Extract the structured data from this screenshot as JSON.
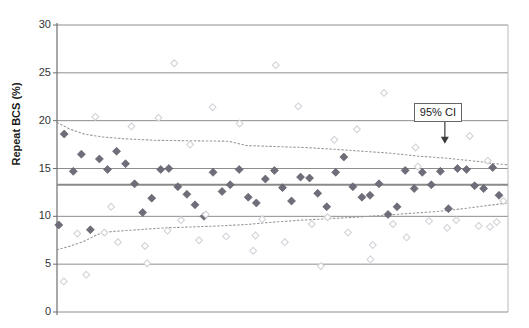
{
  "chart": {
    "type": "scatter",
    "ylabel": "Repeat BCS (%)",
    "annotation_label": "95% CI"
  },
  "axis": {
    "ticks": [
      "30",
      "25",
      "20",
      "15",
      "10",
      "5",
      "0"
    ]
  },
  "chart_data": {
    "type": "scatter",
    "title": "",
    "xlabel": "",
    "ylabel": "Repeat BCS (%)",
    "ylim": [
      0,
      30
    ],
    "xlim": [
      0,
      100
    ],
    "yticks": [
      0,
      5,
      10,
      15,
      20,
      25,
      30
    ],
    "grid": true,
    "legend": false,
    "annotations": [
      {
        "text": "95% CI",
        "x": 86,
        "y": 21.0,
        "arrow_to_x": 86,
        "arrow_to_y": 17.6
      }
    ],
    "reference_lines": [
      {
        "name": "mean",
        "value": 13.3,
        "style": "solid",
        "color": "#8a8a8a",
        "width": 2.2
      }
    ],
    "series": [
      {
        "name": "Cumulative mean (filled diamonds)",
        "marker": "filled-diamond",
        "color": "#6e6e7a",
        "points": [
          [
            0.4,
            9.1
          ],
          [
            1.6,
            18.6
          ],
          [
            3.6,
            14.7
          ],
          [
            5.4,
            16.5
          ],
          [
            7.4,
            8.6
          ],
          [
            9.4,
            16.0
          ],
          [
            11.2,
            14.9
          ],
          [
            13.2,
            16.8
          ],
          [
            15.2,
            15.5
          ],
          [
            17.2,
            13.4
          ],
          [
            19.0,
            10.4
          ],
          [
            21.0,
            11.9
          ],
          [
            23.0,
            14.9
          ],
          [
            24.8,
            15.0
          ],
          [
            26.8,
            13.1
          ],
          [
            28.8,
            12.3
          ],
          [
            30.6,
            11.2
          ],
          [
            32.6,
            10.0
          ],
          [
            34.6,
            14.6
          ],
          [
            36.6,
            12.6
          ],
          [
            38.4,
            13.3
          ],
          [
            40.4,
            14.9
          ],
          [
            42.4,
            12.0
          ],
          [
            44.2,
            11.4
          ],
          [
            46.2,
            13.9
          ],
          [
            48.2,
            14.8
          ],
          [
            50.0,
            13.0
          ],
          [
            52.0,
            11.6
          ],
          [
            54.0,
            14.1
          ],
          [
            56.0,
            14.0
          ],
          [
            57.8,
            12.4
          ],
          [
            59.8,
            11.0
          ],
          [
            61.8,
            14.6
          ],
          [
            63.6,
            16.2
          ],
          [
            65.6,
            13.1
          ],
          [
            67.6,
            12.0
          ],
          [
            69.4,
            12.2
          ],
          [
            71.4,
            13.4
          ],
          [
            73.4,
            10.2
          ],
          [
            75.4,
            11.0
          ],
          [
            77.2,
            14.8
          ],
          [
            79.2,
            12.9
          ],
          [
            81.0,
            14.6
          ],
          [
            83.0,
            13.3
          ],
          [
            85.0,
            14.7
          ],
          [
            86.8,
            10.8
          ],
          [
            88.8,
            15.0
          ],
          [
            90.8,
            14.9
          ],
          [
            92.6,
            13.2
          ],
          [
            94.6,
            12.9
          ],
          [
            96.6,
            15.1
          ],
          [
            98.0,
            12.2
          ]
        ]
      },
      {
        "name": "Individual observations (open diamonds)",
        "marker": "open-diamond",
        "color": "#d2d2d8",
        "points": [
          [
            1.5,
            3.2
          ],
          [
            4.5,
            8.2
          ],
          [
            6.5,
            3.9
          ],
          [
            8.5,
            20.4
          ],
          [
            10.5,
            8.3
          ],
          [
            13.5,
            7.3
          ],
          [
            16.5,
            19.4
          ],
          [
            19.5,
            6.9
          ],
          [
            22.5,
            20.3
          ],
          [
            24.5,
            8.5
          ],
          [
            27.5,
            9.6
          ],
          [
            29.5,
            17.5
          ],
          [
            31.5,
            7.5
          ],
          [
            34.5,
            21.4
          ],
          [
            37.5,
            7.9
          ],
          [
            40.5,
            19.7
          ],
          [
            43.5,
            6.4
          ],
          [
            45.5,
            9.7
          ],
          [
            48.5,
            25.8
          ],
          [
            50.5,
            7.3
          ],
          [
            53.5,
            21.5
          ],
          [
            56.5,
            9.2
          ],
          [
            58.5,
            4.8
          ],
          [
            61.5,
            18.0
          ],
          [
            64.5,
            8.3
          ],
          [
            66.5,
            19.1
          ],
          [
            69.5,
            5.5
          ],
          [
            72.5,
            22.9
          ],
          [
            74.5,
            9.2
          ],
          [
            77.5,
            7.8
          ],
          [
            79.5,
            17.2
          ],
          [
            82.5,
            9.5
          ],
          [
            84.5,
            20.5
          ],
          [
            86.5,
            8.8
          ],
          [
            88.5,
            9.6
          ],
          [
            91.5,
            18.4
          ],
          [
            93.5,
            9.0
          ],
          [
            95.5,
            15.8
          ],
          [
            97.5,
            9.4
          ],
          [
            99.0,
            11.6
          ],
          [
            12.0,
            11.0
          ],
          [
            20.0,
            5.1
          ],
          [
            26.0,
            26.0
          ],
          [
            33.0,
            10.2
          ],
          [
            44.0,
            8.0
          ],
          [
            60.0,
            9.9
          ],
          [
            70.0,
            7.0
          ],
          [
            80.0,
            15.2
          ],
          [
            96.0,
            8.9
          ]
        ]
      }
    ],
    "ci_upper": {
      "name": "95% CI upper",
      "style": "dotted",
      "color": "#9a9a9a",
      "points": [
        [
          0.0,
          19.8
        ],
        [
          3.0,
          19.1
        ],
        [
          6.0,
          18.6
        ],
        [
          10.0,
          18.3
        ],
        [
          15.0,
          18.1
        ],
        [
          22.0,
          17.95
        ],
        [
          30.0,
          17.9
        ],
        [
          38.0,
          17.85
        ],
        [
          42.0,
          17.4
        ],
        [
          48.0,
          17.3
        ],
        [
          55.0,
          17.2
        ],
        [
          62.0,
          17.0
        ],
        [
          68.0,
          16.8
        ],
        [
          74.0,
          16.6
        ],
        [
          80.0,
          16.3
        ],
        [
          86.0,
          16.1
        ],
        [
          90.0,
          15.9
        ],
        [
          94.0,
          15.7
        ],
        [
          97.0,
          15.5
        ],
        [
          100.0,
          15.4
        ]
      ]
    },
    "ci_lower": {
      "name": "95% CI lower",
      "style": "dotted",
      "color": "#9a9a9a",
      "points": [
        [
          0.0,
          6.5
        ],
        [
          3.0,
          6.9
        ],
        [
          6.0,
          7.4
        ],
        [
          9.0,
          8.1
        ],
        [
          12.0,
          8.4
        ],
        [
          18.0,
          8.6
        ],
        [
          24.0,
          8.8
        ],
        [
          30.0,
          8.9
        ],
        [
          36.0,
          9.0
        ],
        [
          42.0,
          9.15
        ],
        [
          48.0,
          9.4
        ],
        [
          54.0,
          9.6
        ],
        [
          60.0,
          9.75
        ],
        [
          66.0,
          9.9
        ],
        [
          72.0,
          10.1
        ],
        [
          78.0,
          10.3
        ],
        [
          84.0,
          10.5
        ],
        [
          90.0,
          10.8
        ],
        [
          95.0,
          11.1
        ],
        [
          100.0,
          11.4
        ]
      ]
    }
  }
}
